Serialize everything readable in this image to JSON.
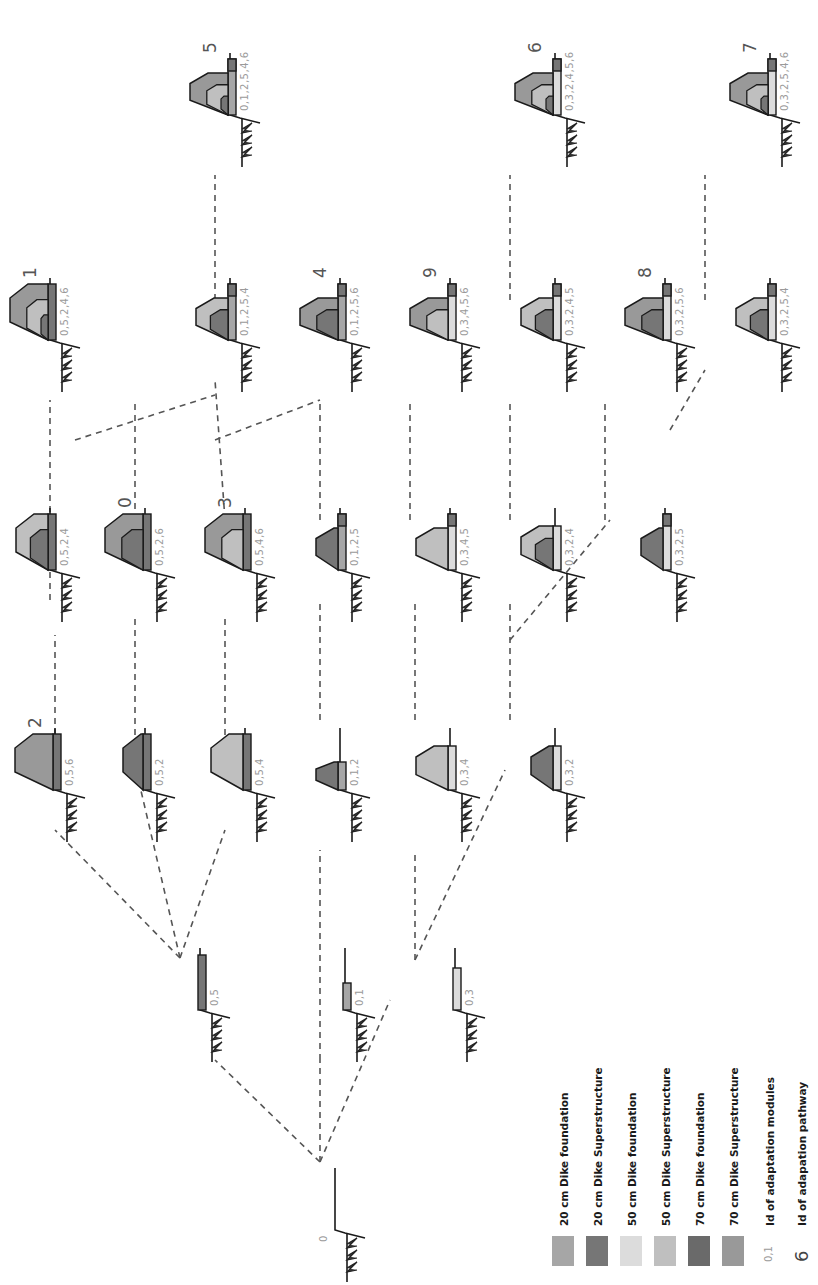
{
  "colors": {
    "f20": "#a6a6a6",
    "s20": "#767676",
    "f50": "#dcdcdc",
    "s50": "#bfbfbf",
    "f70": "#6a6a6a",
    "s70": "#999999",
    "line": "#1a1a1a",
    "dash": "#555555",
    "module_text": "#9a9a9a",
    "pathway_text": "#555555"
  },
  "legend": {
    "items": [
      {
        "key": "f20",
        "label": "20 cm Dike foundation"
      },
      {
        "key": "s20",
        "label": "20 cm Dike Superstructure"
      },
      {
        "key": "f50",
        "label": "50 cm Dike foundation"
      },
      {
        "key": "s50",
        "label": "50 cm Dike Superstructure"
      },
      {
        "key": "f70",
        "label": "70 cm Dike foundation"
      },
      {
        "key": "s70",
        "label": "70 cm Dike Superstructure"
      }
    ],
    "module_example": "0,1",
    "module_label": "Id of adaptation modules",
    "pathway_example": "6",
    "pathway_label": "Id of adapation pathway"
  },
  "nodes": [
    {
      "id": "0",
      "x": 335,
      "y": 1230,
      "modules": "0",
      "pathway": "",
      "found": null,
      "super": null,
      "height": 0,
      "root": true
    },
    {
      "id": "0,5",
      "x": 200,
      "y": 1010,
      "modules": "0,5",
      "pathway": "",
      "found": "s20",
      "super": null,
      "height": 55,
      "crest": 0
    },
    {
      "id": "0,1",
      "x": 345,
      "y": 1010,
      "modules": "0,1",
      "pathway": "",
      "found": "f20",
      "super": null,
      "height": 27,
      "crest": 0
    },
    {
      "id": "0,3",
      "x": 455,
      "y": 1010,
      "modules": "0,3",
      "pathway": "",
      "found": "f50",
      "super": null,
      "height": 42,
      "crest": 0
    },
    {
      "id": "0,5,6",
      "x": 55,
      "y": 790,
      "modules": "0,5,6",
      "pathway": "2",
      "found": "s20",
      "super": "s70",
      "height": 56,
      "crest": 22
    },
    {
      "id": "0,5,2",
      "x": 145,
      "y": 790,
      "modules": "0,5,2",
      "pathway": "",
      "found": "s20",
      "super": "s20",
      "height": 56,
      "crest": 4
    },
    {
      "id": "0,5,4",
      "x": 245,
      "y": 790,
      "modules": "0,5,4",
      "pathway": "",
      "found": "s20",
      "super": "s50",
      "height": 56,
      "crest": 16
    },
    {
      "id": "0,1,2",
      "x": 340,
      "y": 790,
      "modules": "0,1,2",
      "pathway": "",
      "found": "f20",
      "super": "s20",
      "height": 28,
      "crest": 6
    },
    {
      "id": "0,3,4",
      "x": 450,
      "y": 790,
      "modules": "0,3,4",
      "pathway": "",
      "found": "f50",
      "super": "s50",
      "height": 44,
      "crest": 16
    },
    {
      "id": "0,3,2",
      "x": 555,
      "y": 790,
      "modules": "0,3,2",
      "pathway": "",
      "found": "f50",
      "super": "s20",
      "height": 44,
      "crest": 6
    },
    {
      "id": "0,5,2,4",
      "x": 50,
      "y": 570,
      "modules": "0,5,2,4",
      "pathway": "",
      "found": "s20",
      "super": "s50",
      "height": 56,
      "crest": 16,
      "inner": "s20"
    },
    {
      "id": "0,5,2,6",
      "x": 145,
      "y": 570,
      "modules": "0,5,2,6",
      "pathway": "0",
      "found": "s20",
      "super": "s70",
      "height": 56,
      "crest": 22,
      "inner": "s20"
    },
    {
      "id": "0,5,4,6",
      "x": 245,
      "y": 570,
      "modules": "0,5,4,6",
      "pathway": "3",
      "found": "s20",
      "super": "s70",
      "height": 56,
      "crest": 22,
      "inner": "s50"
    },
    {
      "id": "0,1,2,5",
      "x": 340,
      "y": 570,
      "modules": "0,1,2,5",
      "pathway": "",
      "found": "f20",
      "super": "s20",
      "height": 56,
      "crest": 6,
      "top": "s20"
    },
    {
      "id": "0,3,4,5",
      "x": 450,
      "y": 570,
      "modules": "0,3,4,5",
      "pathway": "",
      "found": "f50",
      "super": "s50",
      "height": 56,
      "crest": 16,
      "top": "s20"
    },
    {
      "id": "0,3,2,4",
      "x": 555,
      "y": 570,
      "modules": "0,3,2,4",
      "pathway": "",
      "found": "f50",
      "super": "s50",
      "height": 44,
      "crest": 16,
      "inner": "s20"
    },
    {
      "id": "0,3,2,5",
      "x": 665,
      "y": 570,
      "modules": "0,3,2,5",
      "pathway": "",
      "found": "f50",
      "super": "s20",
      "height": 56,
      "crest": 6,
      "top": "s20"
    },
    {
      "id": "0,5,2,4,6",
      "x": 50,
      "y": 340,
      "modules": "0,5,2,4,6",
      "pathway": "1",
      "found": "s20",
      "super": "s70",
      "height": 56,
      "crest": 22,
      "inner": "s50",
      "inner2": "s20"
    },
    {
      "id": "0,1,2,5,4",
      "x": 230,
      "y": 340,
      "modules": "0,1,2,5,4",
      "pathway": "",
      "found": "f20",
      "super": "s50",
      "height": 56,
      "crest": 16,
      "top": "s20",
      "inner": "s20"
    },
    {
      "id": "0,1,2,5,6",
      "x": 340,
      "y": 340,
      "modules": "0,1,2,5,6",
      "pathway": "4",
      "found": "f20",
      "super": "s70",
      "height": 56,
      "crest": 22,
      "top": "s20",
      "inner": "s20"
    },
    {
      "id": "0,3,4,5,6",
      "x": 450,
      "y": 340,
      "modules": "0,3,4,5,6",
      "pathway": "9",
      "found": "f50",
      "super": "s70",
      "height": 56,
      "crest": 22,
      "top": "s20",
      "inner": "s50"
    },
    {
      "id": "0,3,2,4,5",
      "x": 555,
      "y": 340,
      "modules": "0,3,2,4,5",
      "pathway": "",
      "found": "f50",
      "super": "s50",
      "height": 56,
      "crest": 16,
      "top": "s20",
      "inner": "s20"
    },
    {
      "id": "0,3,2,5,6",
      "x": 665,
      "y": 340,
      "modules": "0,3,2,5,6",
      "pathway": "8",
      "found": "f50",
      "super": "s70",
      "height": 56,
      "crest": 22,
      "top": "s20",
      "inner": "s20"
    },
    {
      "id": "0,3,2,5,4",
      "x": 770,
      "y": 340,
      "modules": "0,3,2,5,4",
      "pathway": "",
      "found": "f50",
      "super": "s50",
      "height": 56,
      "crest": 16,
      "top": "s20",
      "inner": "s20"
    },
    {
      "id": "0,1,2,5,4,6",
      "x": 230,
      "y": 115,
      "modules": "0,1,2,5,4,6",
      "pathway": "5",
      "found": "f20",
      "super": "s70",
      "height": 56,
      "crest": 22,
      "top": "s20",
      "inner": "s50",
      "inner2": "s20"
    },
    {
      "id": "0,3,2,4,5,6",
      "x": 555,
      "y": 115,
      "modules": "0,3,2,4,5,6",
      "pathway": "6",
      "found": "f50",
      "super": "s70",
      "height": 56,
      "crest": 22,
      "top": "s20",
      "inner": "s50",
      "inner2": "s20"
    },
    {
      "id": "0,3,2,5,4,6",
      "x": 770,
      "y": 115,
      "modules": "0,3,2,5,4,6",
      "pathway": "7",
      "found": "f50",
      "super": "s70",
      "height": 56,
      "crest": 22,
      "top": "s20",
      "inner": "s50",
      "inner2": "s20"
    }
  ],
  "edges": [
    {
      "x1": 320,
      "y1": 1162,
      "x2": 215,
      "y2": 1060
    },
    {
      "x1": 320,
      "y1": 1162,
      "x2": 320,
      "y2": 1060
    },
    {
      "x1": 320,
      "y1": 1162,
      "x2": 390,
      "y2": 1000
    },
    {
      "x1": 180,
      "y1": 958,
      "x2": 55,
      "y2": 830
    },
    {
      "x1": 180,
      "y1": 958,
      "x2": 135,
      "y2": 765
    },
    {
      "x1": 180,
      "y1": 958,
      "x2": 225,
      "y2": 830
    },
    {
      "x1": 320,
      "y1": 1060,
      "x2": 320,
      "y2": 850
    },
    {
      "x1": 415,
      "y1": 960,
      "x2": 415,
      "y2": 850
    },
    {
      "x1": 415,
      "y1": 960,
      "x2": 505,
      "y2": 770
    },
    {
      "x1": 55,
      "y1": 735,
      "x2": 55,
      "y2": 635
    },
    {
      "x1": 135,
      "y1": 735,
      "x2": 135,
      "y2": 615
    },
    {
      "x1": 225,
      "y1": 735,
      "x2": 225,
      "y2": 615
    },
    {
      "x1": 320,
      "y1": 720,
      "x2": 320,
      "y2": 600
    },
    {
      "x1": 415,
      "y1": 720,
      "x2": 415,
      "y2": 600
    },
    {
      "x1": 510,
      "y1": 720,
      "x2": 510,
      "y2": 600
    },
    {
      "x1": 510,
      "y1": 640,
      "x2": 610,
      "y2": 520
    },
    {
      "x1": 50,
      "y1": 600,
      "x2": 50,
      "y2": 400
    },
    {
      "x1": 75,
      "y1": 440,
      "x2": 215,
      "y2": 395
    },
    {
      "x1": 135,
      "y1": 520,
      "x2": 135,
      "y2": 400
    },
    {
      "x1": 225,
      "y1": 520,
      "x2": 215,
      "y2": 380
    },
    {
      "x1": 215,
      "y1": 440,
      "x2": 320,
      "y2": 400
    },
    {
      "x1": 320,
      "y1": 520,
      "x2": 320,
      "y2": 400
    },
    {
      "x1": 410,
      "y1": 520,
      "x2": 410,
      "y2": 400
    },
    {
      "x1": 510,
      "y1": 520,
      "x2": 510,
      "y2": 400
    },
    {
      "x1": 605,
      "y1": 520,
      "x2": 605,
      "y2": 400
    },
    {
      "x1": 670,
      "y1": 430,
      "x2": 705,
      "y2": 370
    },
    {
      "x1": 215,
      "y1": 300,
      "x2": 215,
      "y2": 175
    },
    {
      "x1": 510,
      "y1": 300,
      "x2": 510,
      "y2": 175
    },
    {
      "x1": 705,
      "y1": 300,
      "x2": 705,
      "y2": 175
    }
  ]
}
